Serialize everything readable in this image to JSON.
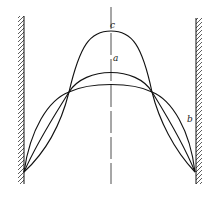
{
  "diagram": {
    "type": "buckled-column-modes",
    "labels": {
      "a": "a",
      "b": "b",
      "c": "c"
    },
    "colors": {
      "stroke": "#111111",
      "hatch": "#333333",
      "background": "#ffffff"
    }
  }
}
